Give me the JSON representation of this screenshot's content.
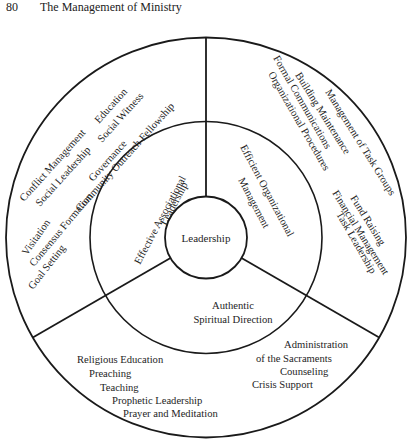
{
  "header": {
    "page_number": "80",
    "running_title": "The Management of Ministry"
  },
  "diagram": {
    "center_label": "Leadership",
    "segments": [
      {
        "id": "associational",
        "label_lines": [
          "Effective Associational",
          "Leadership"
        ],
        "items": [
          "Conflict Management",
          "Social Leadership",
          "Governance",
          "Education",
          "Social Witness",
          "Community Outreach Fellowship",
          "Visitation",
          "Consensus Formation",
          "Goal Setting"
        ]
      },
      {
        "id": "organizational",
        "label_lines": [
          "Efficient Organizational",
          "Management"
        ],
        "items": [
          "Formal Communications",
          "Building Maintenance",
          "Organizational Procedures",
          "Management of Task Groups",
          "Fund Raising",
          "Financial Management",
          "Task Leadership"
        ]
      },
      {
        "id": "spiritual",
        "label_lines": [
          "Authentic",
          "Spiritual Direction"
        ],
        "items": [
          "Religious Education",
          "Preaching",
          "Teaching",
          "Prophetic Leadership",
          "Prayer and Meditation",
          "Administration",
          "of the Sacraments",
          "Counseling",
          "Crisis Support"
        ]
      }
    ]
  }
}
